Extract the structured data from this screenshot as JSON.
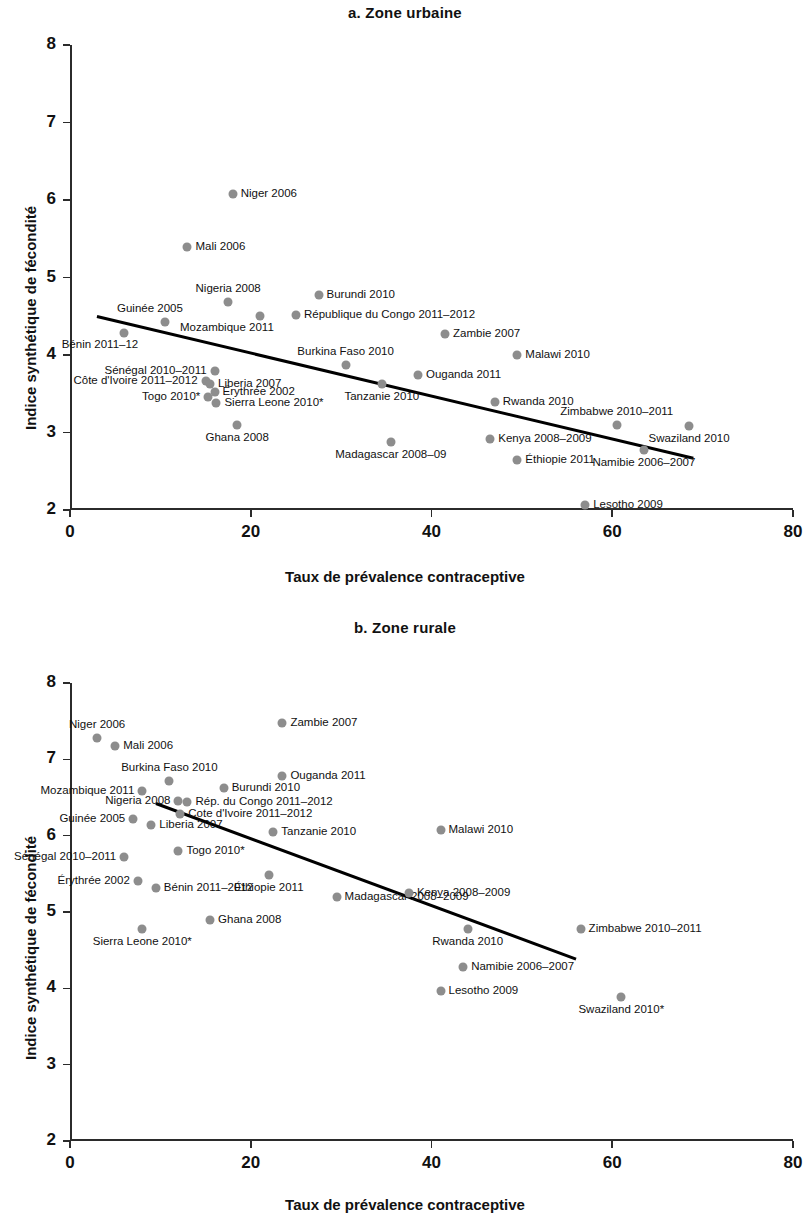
{
  "figure": {
    "axis_x_title": "Taux de prévalence contraceptive",
    "axis_y_title": "Indice synthétique de fécondité",
    "marker_color": "#8d8d8d",
    "trend_color": "#000000"
  },
  "panel_a": {
    "title": "a. Zone urbaine",
    "x_ticks": [
      "0",
      "20",
      "40",
      "60",
      "80"
    ],
    "y_ticks": [
      "8",
      "7",
      "6",
      "5",
      "4",
      "3",
      "2"
    ]
  },
  "panel_b": {
    "title": "b. Zone rurale",
    "x_ticks": [
      "0",
      "20",
      "40",
      "60",
      "80"
    ],
    "y_ticks": [
      "8",
      "7",
      "6",
      "5",
      "4",
      "3",
      "2"
    ]
  },
  "chart_data": [
    {
      "type": "scatter",
      "panel": "a",
      "title": "a. Zone urbaine",
      "xlabel": "Taux de prévalence contraceptive",
      "ylabel": "Indice synthétique de fécondité",
      "xlim": [
        0,
        80
      ],
      "ylim": [
        2,
        8
      ],
      "xticks": [
        0,
        20,
        40,
        60,
        80
      ],
      "yticks": [
        2,
        3,
        4,
        5,
        6,
        7,
        8
      ],
      "grid": false,
      "legend": "none",
      "trendline": {
        "x0": 3.0,
        "y0": 4.5,
        "x1": 69.0,
        "y1": 2.67
      },
      "points": [
        {
          "label": "Niger 2006",
          "x": 18.0,
          "y": 6.08,
          "label_side": "right"
        },
        {
          "label": "Mali 2006",
          "x": 13.0,
          "y": 5.4,
          "label_side": "right"
        },
        {
          "label": "Nigeria 2008",
          "x": 17.5,
          "y": 4.68,
          "label_side": "above"
        },
        {
          "label": "Burundi 2010",
          "x": 27.5,
          "y": 4.78,
          "label_side": "right"
        },
        {
          "label": "Guinée 2005",
          "x": 10.5,
          "y": 4.42,
          "label_side": "above-left"
        },
        {
          "label": "Mozambique 2011",
          "x": 21.0,
          "y": 4.5,
          "label_side": "below-left"
        },
        {
          "label": "République du Congo  2011–2012",
          "x": 25.0,
          "y": 4.52,
          "label_side": "right"
        },
        {
          "label": "Zambie 2007",
          "x": 41.5,
          "y": 4.27,
          "label_side": "right"
        },
        {
          "label": "Bénin 2011–12",
          "x": 6.0,
          "y": 4.28,
          "label_side": "below-left"
        },
        {
          "label": "Burkina Faso 2010",
          "x": 30.5,
          "y": 3.87,
          "label_side": "above"
        },
        {
          "label": "Malawi 2010",
          "x": 49.5,
          "y": 4.0,
          "label_side": "right"
        },
        {
          "label": "Sénégal  2010–2011",
          "x": 16.0,
          "y": 3.8,
          "label_side": "left"
        },
        {
          "label": "Ouganda 2011",
          "x": 38.5,
          "y": 3.74,
          "label_side": "right"
        },
        {
          "label": "Côte d'Ivoire 2011–2012",
          "x": 15.0,
          "y": 3.67,
          "label_side": "left"
        },
        {
          "label": "Liberia 2007",
          "x": 15.5,
          "y": 3.63,
          "label_side": "right"
        },
        {
          "label": "Tanzanie 2010",
          "x": 34.5,
          "y": 3.63,
          "label_side": "below"
        },
        {
          "label": "Togo 2010*",
          "x": 15.3,
          "y": 3.46,
          "label_side": "left"
        },
        {
          "label": "Érythrée 2002",
          "x": 16.0,
          "y": 3.52,
          "label_side": "right"
        },
        {
          "label": "Sierra Leone  2010*",
          "x": 16.2,
          "y": 3.38,
          "label_side": "right"
        },
        {
          "label": "Rwanda 2010",
          "x": 47.0,
          "y": 3.4,
          "label_side": "right"
        },
        {
          "label": "Zimbabwe 2010–2011",
          "x": 60.5,
          "y": 3.1,
          "label_side": "above"
        },
        {
          "label": "Ghana 2008",
          "x": 18.5,
          "y": 3.1,
          "label_side": "below"
        },
        {
          "label": "Swaziland 2010",
          "x": 68.5,
          "y": 3.08,
          "label_side": "below"
        },
        {
          "label": "Kenya 2008–2009",
          "x": 46.5,
          "y": 2.92,
          "label_side": "right"
        },
        {
          "label": "Madagascar 2008–09",
          "x": 35.5,
          "y": 2.88,
          "label_side": "below"
        },
        {
          "label": "Éthiopie 2011",
          "x": 49.5,
          "y": 2.65,
          "label_side": "right"
        },
        {
          "label": "Namibie 2006–2007",
          "x": 63.5,
          "y": 2.77,
          "label_side": "below"
        },
        {
          "label": "Lesotho 2009",
          "x": 57.0,
          "y": 2.07,
          "label_side": "right"
        }
      ]
    },
    {
      "type": "scatter",
      "panel": "b",
      "title": "b. Zone rurale",
      "xlabel": "Taux de prévalence contraceptive",
      "ylabel": "Indice synthétique de fécondité",
      "xlim": [
        0,
        80
      ],
      "ylim": [
        2,
        8
      ],
      "xticks": [
        0,
        20,
        40,
        60,
        80
      ],
      "yticks": [
        2,
        3,
        4,
        5,
        6,
        7,
        8
      ],
      "grid": false,
      "legend": "none",
      "trendline": {
        "x0": 9.5,
        "y0": 6.42,
        "x1": 56.0,
        "y1": 4.38
      },
      "points": [
        {
          "label": "Zambie 2007",
          "x": 23.5,
          "y": 7.48,
          "label_side": "right"
        },
        {
          "label": "Niger 2006",
          "x": 3.0,
          "y": 7.28,
          "label_side": "above"
        },
        {
          "label": "Mali 2006",
          "x": 5.0,
          "y": 7.18,
          "label_side": "right"
        },
        {
          "label": "Burkina Faso 2010",
          "x": 11.0,
          "y": 6.72,
          "label_side": "above"
        },
        {
          "label": "Ouganda 2011",
          "x": 23.5,
          "y": 6.78,
          "label_side": "right"
        },
        {
          "label": "Mozambique 2011",
          "x": 8.0,
          "y": 6.58,
          "label_side": "left"
        },
        {
          "label": "Burundi 2010",
          "x": 17.0,
          "y": 6.62,
          "label_side": "right"
        },
        {
          "label": "Nigeria 2008",
          "x": 12.0,
          "y": 6.46,
          "label_side": "left"
        },
        {
          "label": "Rép. du Congo  2011–2012",
          "x": 13.0,
          "y": 6.44,
          "label_side": "right"
        },
        {
          "label": "Cote d'Ivoire 2011–2012",
          "x": 12.2,
          "y": 6.28,
          "label_side": "right"
        },
        {
          "label": "Guinée 2005",
          "x": 7.0,
          "y": 6.22,
          "label_side": "left"
        },
        {
          "label": "Liberia 2007",
          "x": 9.0,
          "y": 6.14,
          "label_side": "right"
        },
        {
          "label": "Tanzanie 2010",
          "x": 22.5,
          "y": 6.05,
          "label_side": "right"
        },
        {
          "label": "Malawi 2010",
          "x": 41.0,
          "y": 6.07,
          "label_side": "right"
        },
        {
          "label": "Sénégal 2010–2011",
          "x": 6.0,
          "y": 5.72,
          "label_side": "left"
        },
        {
          "label": "Togo 2010*",
          "x": 12.0,
          "y": 5.8,
          "label_side": "right"
        },
        {
          "label": "Érythrée 2002",
          "x": 7.5,
          "y": 5.4,
          "label_side": "left"
        },
        {
          "label": "Bénin 2011–2012",
          "x": 9.5,
          "y": 5.32,
          "label_side": "right"
        },
        {
          "label": "Éthiopie 2011",
          "x": 22.0,
          "y": 5.48,
          "label_side": "below"
        },
        {
          "label": "Madagascar 2008–2009",
          "x": 29.5,
          "y": 5.2,
          "label_side": "right"
        },
        {
          "label": "Kenya 2008–2009",
          "x": 37.5,
          "y": 5.25,
          "label_side": "right"
        },
        {
          "label": "Sierra Leone 2010*",
          "x": 8.0,
          "y": 4.78,
          "label_side": "below"
        },
        {
          "label": "Ghana 2008",
          "x": 15.5,
          "y": 4.9,
          "label_side": "right"
        },
        {
          "label": "Rwanda 2010",
          "x": 44.0,
          "y": 4.78,
          "label_side": "below"
        },
        {
          "label": "Zimbabwe 2010–2011",
          "x": 56.5,
          "y": 4.78,
          "label_side": "right"
        },
        {
          "label": "Namibie 2006–2007",
          "x": 43.5,
          "y": 4.28,
          "label_side": "right"
        },
        {
          "label": "Lesotho 2009",
          "x": 41.0,
          "y": 3.97,
          "label_side": "right"
        },
        {
          "label": "Swaziland 2010*",
          "x": 61.0,
          "y": 3.88,
          "label_side": "below"
        }
      ]
    }
  ]
}
